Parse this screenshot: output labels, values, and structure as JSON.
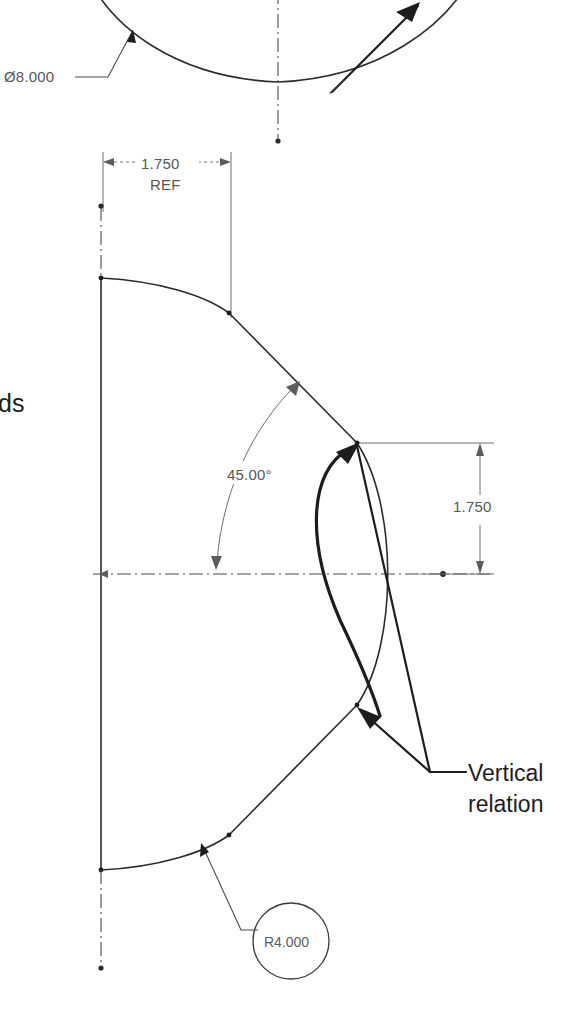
{
  "drawing": {
    "title": "SolidWorks sketch dimension view",
    "background_color": "#ffffff",
    "line_color": "#2b2b2b",
    "dimension_color": "#575757",
    "annotation_color": "#1d1d1d",
    "width": 585,
    "height": 1033
  },
  "dimensions": {
    "diameter_top": {
      "label": "Ø8.000",
      "value": "8.000",
      "symbol": "Ø",
      "type": "diameter"
    },
    "ref_width": {
      "label": "1.750",
      "sub_label": "REF",
      "value": "1.750",
      "type": "linear-horizontal"
    },
    "angle": {
      "label": "45.00°",
      "value": "45.00",
      "unit": "°",
      "type": "angular"
    },
    "height_right": {
      "label": "1.750",
      "value": "1.750",
      "type": "linear-vertical"
    },
    "radius_balloon": {
      "label": "R4.000",
      "value": "4.000",
      "symbol": "R",
      "type": "radius"
    }
  },
  "annotations": {
    "relation_note": {
      "line1": "Vertical",
      "line2": "relation",
      "full": "Vertical relation"
    },
    "clipped_note": {
      "text": "ds"
    }
  },
  "icons": {
    "arrow_leader": "arrow-head-icon",
    "centerline": "centerline-icon",
    "balloon": "balloon-circle-icon"
  }
}
